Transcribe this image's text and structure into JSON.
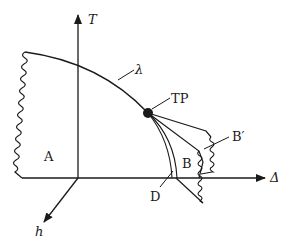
{
  "diagram": {
    "axes": {
      "vertical": "T",
      "horizontal": "Δ",
      "oblique": "h"
    },
    "labels": {
      "region_a": "A",
      "region_b": "B",
      "region_b_prime": "B′",
      "line_d": "D",
      "curve_lambda": "λ",
      "tricritical_point": "TP"
    },
    "colors": {
      "ink": "#1a1a1a",
      "background": "#ffffff"
    }
  }
}
